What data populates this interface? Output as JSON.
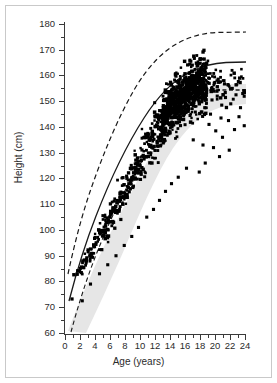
{
  "chart_data": {
    "type": "scatter",
    "title": "",
    "xlabel": "Age (years)",
    "ylabel": "Height (cm)",
    "xlim": [
      0,
      24
    ],
    "ylim": [
      60,
      180
    ],
    "xticks": [
      0,
      2,
      4,
      6,
      8,
      10,
      12,
      14,
      16,
      18,
      20,
      22,
      24
    ],
    "yticks": [
      60,
      70,
      80,
      90,
      100,
      110,
      120,
      130,
      140,
      150,
      160,
      170,
      180
    ],
    "xtick_labels": [
      "0",
      "2",
      "4",
      "6",
      "8",
      "10",
      "12",
      "14",
      "16",
      "18",
      "20",
      "22",
      "24"
    ],
    "ytick_labels": [
      "60",
      "70",
      "80",
      "90",
      "100",
      "110",
      "120",
      "130",
      "140",
      "150",
      "160",
      "170",
      "180"
    ],
    "grid": false,
    "legend": "none",
    "marker": "filled-square",
    "marker_color": "#000000",
    "series": [
      {
        "name": "patient-heights",
        "type": "scatter",
        "points": [
          [
            1.2,
            73.5
          ],
          [
            1.6,
            76.0
          ],
          [
            1.9,
            79.5
          ],
          [
            2.1,
            81.0
          ],
          [
            2.3,
            78.5
          ],
          [
            2.5,
            83.0
          ],
          [
            2.6,
            80.5
          ],
          [
            2.8,
            85.0
          ],
          [
            3.0,
            87.5
          ],
          [
            3.1,
            84.0
          ],
          [
            3.3,
            89.0
          ],
          [
            3.4,
            86.0
          ],
          [
            3.6,
            91.0
          ],
          [
            3.8,
            88.5
          ],
          [
            3.9,
            93.0
          ],
          [
            4.0,
            90.0
          ],
          [
            4.1,
            95.0
          ],
          [
            4.2,
            92.0
          ],
          [
            4.4,
            96.5
          ],
          [
            4.5,
            93.5
          ],
          [
            4.6,
            98.0
          ],
          [
            4.8,
            95.0
          ],
          [
            4.9,
            99.5
          ],
          [
            5.0,
            96.0
          ],
          [
            5.1,
            101.0
          ],
          [
            5.2,
            97.5
          ],
          [
            5.3,
            102.5
          ],
          [
            5.4,
            99.0
          ],
          [
            5.5,
            103.0
          ],
          [
            5.6,
            100.0
          ],
          [
            5.7,
            104.5
          ],
          [
            5.8,
            101.5
          ],
          [
            5.9,
            105.5
          ],
          [
            6.0,
            102.0
          ],
          [
            6.1,
            106.5
          ],
          [
            6.2,
            103.0
          ],
          [
            6.3,
            107.5
          ],
          [
            6.4,
            104.0
          ],
          [
            6.5,
            108.5
          ],
          [
            6.6,
            105.0
          ],
          [
            6.7,
            109.5
          ],
          [
            6.8,
            106.0
          ],
          [
            6.9,
            110.5
          ],
          [
            7.0,
            107.0
          ],
          [
            7.1,
            111.0
          ],
          [
            7.2,
            108.0
          ],
          [
            7.3,
            112.0
          ],
          [
            7.4,
            109.0
          ],
          [
            7.5,
            113.0
          ],
          [
            7.6,
            110.0
          ],
          [
            7.7,
            113.5
          ],
          [
            7.8,
            111.0
          ],
          [
            7.9,
            114.5
          ],
          [
            8.0,
            112.0
          ],
          [
            8.1,
            115.0
          ],
          [
            8.2,
            112.5
          ],
          [
            8.3,
            116.0
          ],
          [
            8.4,
            113.0
          ],
          [
            8.5,
            116.5
          ],
          [
            8.6,
            114.0
          ],
          [
            8.7,
            117.0
          ],
          [
            8.8,
            114.5
          ],
          [
            8.9,
            118.0
          ],
          [
            9.0,
            115.0
          ],
          [
            9.1,
            118.5
          ],
          [
            9.2,
            116.0
          ],
          [
            9.3,
            119.0
          ],
          [
            9.4,
            116.5
          ],
          [
            9.5,
            120.0
          ],
          [
            9.6,
            117.0
          ],
          [
            9.7,
            120.5
          ],
          [
            9.8,
            118.0
          ],
          [
            9.9,
            121.0
          ],
          [
            10.0,
            118.5
          ],
          [
            10.2,
            122.0
          ],
          [
            10.4,
            119.0
          ],
          [
            10.6,
            123.0
          ],
          [
            10.8,
            120.0
          ],
          [
            11.0,
            124.0
          ],
          [
            11.2,
            121.0
          ],
          [
            11.4,
            125.0
          ],
          [
            11.6,
            122.0
          ],
          [
            11.8,
            126.5
          ],
          [
            12.0,
            123.5
          ],
          [
            12.2,
            128.0
          ],
          [
            12.4,
            125.0
          ],
          [
            12.6,
            130.0
          ],
          [
            12.8,
            126.5
          ],
          [
            13.0,
            132.0
          ],
          [
            13.2,
            128.0
          ],
          [
            13.4,
            134.0
          ],
          [
            13.6,
            130.0
          ],
          [
            13.8,
            136.0
          ],
          [
            14.0,
            132.0
          ],
          [
            14.2,
            138.5
          ],
          [
            14.4,
            134.0
          ],
          [
            14.6,
            141.0
          ],
          [
            14.8,
            136.0
          ],
          [
            15.0,
            143.5
          ],
          [
            15.2,
            138.0
          ],
          [
            15.4,
            145.5
          ],
          [
            15.6,
            140.0
          ],
          [
            15.8,
            147.0
          ],
          [
            16.0,
            142.0
          ],
          [
            16.2,
            148.5
          ],
          [
            16.4,
            144.0
          ],
          [
            16.6,
            150.0
          ],
          [
            16.8,
            145.5
          ],
          [
            17.0,
            151.0
          ],
          [
            17.2,
            147.0
          ],
          [
            17.4,
            152.0
          ],
          [
            17.6,
            148.0
          ],
          [
            17.8,
            152.5
          ],
          [
            18.0,
            149.0
          ],
          [
            18.5,
            152.0
          ],
          [
            19.0,
            150.5
          ],
          [
            19.5,
            151.5
          ],
          [
            20.0,
            150.0
          ],
          [
            20.5,
            149.0
          ],
          [
            21.0,
            151.0
          ],
          [
            21.5,
            148.0
          ],
          [
            22.0,
            150.5
          ],
          [
            22.5,
            147.0
          ],
          [
            23.0,
            149.5
          ],
          [
            23.5,
            146.0
          ],
          [
            24.0,
            148.0
          ]
        ],
        "n_approx": 1400,
        "description": "dense cluster of individual height measurements, thickest between ages 13 and 19"
      },
      {
        "name": "reference-median-normal",
        "type": "line",
        "style": "dashed",
        "plateau_height_cm": 177,
        "description": "upper dashed reference growth curve rising from ~62 cm at age 0.4 and plateauing near 177 cm after age 17"
      },
      {
        "name": "patient-mean-growth",
        "type": "line",
        "style": "solid",
        "plateau_height_cm": 164.5,
        "description": "solid growth curve rising from ~62 cm and plateauing near 164.5 cm after age 18"
      },
      {
        "name": "lower-reference",
        "type": "line",
        "style": "dashed",
        "plateau_height_cm": 154,
        "description": "lower dashed reference line, visible as a short horizontal dashed segment near 154 cm at the right of the plot"
      },
      {
        "name": "reference-band",
        "type": "band",
        "color": "#e3e3e3",
        "description": "light gray shaded normal-range band underlying the scatter"
      }
    ]
  }
}
